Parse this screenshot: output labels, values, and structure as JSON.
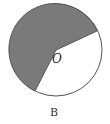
{
  "diagram": {
    "center_label": "O",
    "caption": "B",
    "colors": {
      "shaded": "#7a7a7a",
      "outline": "#555555",
      "background": "#ffffff"
    }
  }
}
